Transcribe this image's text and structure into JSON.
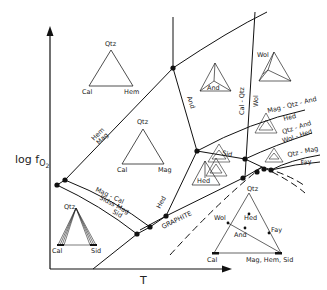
{
  "diagram": {
    "type": "phase diagram (log fO2 vs T)",
    "axes": {
      "y_label_main": "log f",
      "y_label_sub": "O",
      "y_label_subsub": "2",
      "x_label": "T"
    },
    "field_labels": {
      "hem_mag_upper": "Hem",
      "hem_mag_lower": "Mag",
      "and": "And",
      "cal_qtz": "Cal - Qtz",
      "wol": "Wol",
      "mag_qtz_and": "Mag - Qtz - And",
      "mag_qtz_and_hed": "Hed",
      "qtz_and": "Qtz - And",
      "wol_hed": "Wol - Hed",
      "qtz_mag": "Qtz - Mag",
      "fay": "Fay",
      "mag_cal": "Mag - Cal",
      "sidss_mag": "Sidss Mag",
      "sid": "Sid",
      "graphite": "GRAPHITE",
      "hed": "Hed",
      "small_label": "Sid"
    },
    "triangles": {
      "t1": {
        "top": "Qtz",
        "left": "Cal",
        "right": "Hem"
      },
      "t2": {
        "top": "Qtz",
        "left": "Cal",
        "right": "Mag"
      },
      "t3": {
        "top": "Qtz",
        "left": "Cal",
        "right": "Sid"
      },
      "t4": {
        "inner": "And"
      },
      "t5": {
        "top_left": "Wol"
      },
      "t6": {
        "inner": "Hed"
      },
      "legend": {
        "top": "Qtz",
        "left": "Cal",
        "right": "Mag, Hem, Sid",
        "wol": "Wol",
        "hed": "Hed",
        "and": "And",
        "fay": "Fay"
      }
    }
  }
}
